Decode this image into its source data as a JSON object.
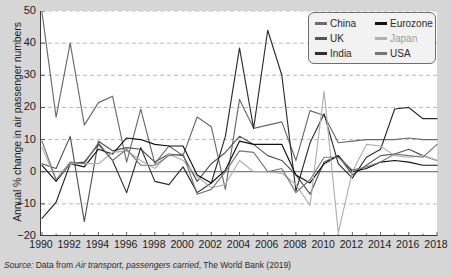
{
  "figure": {
    "partial_title": "",
    "caption": {
      "source_word": "Source:",
      "text_before": " Data from ",
      "work_title": "Air transport, passengers carried",
      "text_after": ", The World Bank (2019)"
    }
  },
  "legend": {
    "columns": [
      [
        {
          "label": "China",
          "color": "#6b6b6b"
        },
        {
          "label": "UK",
          "color": "#555555"
        },
        {
          "label": "India",
          "color": "#2e2e2e"
        }
      ],
      [
        {
          "label": "Eurozone",
          "color": "#111111"
        },
        {
          "label": "Japan",
          "color": "#b0b0b0"
        },
        {
          "label": "USA",
          "color": "#777777"
        }
      ]
    ]
  },
  "chart_data": {
    "type": "line",
    "title": "",
    "xlabel": "",
    "ylabel": "Annual % change in air passenger numbers",
    "xlim": [
      1990,
      2018
    ],
    "ylim": [
      -20,
      50
    ],
    "yticks": [
      50,
      40,
      30,
      20,
      10,
      0,
      -10,
      -20
    ],
    "xticks": [
      1990,
      1992,
      1994,
      1996,
      1998,
      2000,
      2002,
      2004,
      2006,
      2008,
      2010,
      2012,
      2014,
      2016,
      2018
    ],
    "minor_xticks_every": 1,
    "grid": "horizontal-dashed",
    "zero_line": true,
    "legend_position": "top-right",
    "x": [
      1990,
      1991,
      1992,
      1993,
      1994,
      1995,
      1996,
      1997,
      1998,
      1999,
      2000,
      2001,
      2002,
      2003,
      2004,
      2005,
      2006,
      2007,
      2008,
      2009,
      2010,
      2011,
      2012,
      2013,
      2014,
      2015,
      2016,
      2017,
      2018
    ],
    "series": [
      {
        "name": "China",
        "color": "#6b6b6b",
        "values": [
          49.5,
          17.0,
          40.0,
          14.5,
          21.5,
          23.5,
          3.0,
          19.5,
          2.5,
          8.0,
          5.0,
          17.0,
          14.0,
          -5.5,
          22.5,
          13.5,
          14.5,
          15.5,
          3.5,
          19.0,
          17.5,
          9.0,
          9.5,
          10.0,
          10.0,
          10.0,
          10.5,
          10.0,
          10.0
        ]
      },
      {
        "name": "UK",
        "color": "#555555",
        "values": [
          2.5,
          1.0,
          11.0,
          -15.5,
          9.5,
          6.5,
          7.5,
          7.0,
          3.0,
          5.5,
          5.0,
          -3.0,
          2.5,
          6.0,
          11.0,
          8.5,
          5.0,
          3.5,
          -1.0,
          -7.0,
          3.0,
          5.0,
          -1.0,
          2.0,
          5.0,
          5.5,
          7.0,
          5.0,
          3.5
        ]
      },
      {
        "name": "India",
        "color": "#2e2e2e",
        "values": [
          -14.5,
          -9.5,
          2.5,
          3.0,
          8.5,
          3.5,
          -6.5,
          7.5,
          -3.0,
          -4.0,
          1.5,
          -6.5,
          -3.5,
          11.0,
          38.5,
          13.5,
          44.0,
          30.0,
          -6.0,
          9.0,
          18.0,
          2.5,
          -2.0,
          4.5,
          7.0,
          19.5,
          20.0,
          16.5,
          16.5
        ]
      },
      {
        "name": "Eurozone",
        "color": "#111111",
        "values": [
          2.0,
          -3.0,
          2.5,
          1.5,
          7.0,
          5.5,
          10.5,
          10.0,
          8.5,
          8.0,
          8.0,
          -1.0,
          -3.5,
          0.5,
          9.5,
          8.5,
          8.5,
          8.5,
          -1.0,
          -3.5,
          2.5,
          5.0,
          0.0,
          1.0,
          3.0,
          3.5,
          3.0,
          2.0,
          2.0
        ]
      },
      {
        "name": "Japan",
        "color": "#b0b0b0",
        "values": [
          7.5,
          -2.5,
          2.5,
          2.5,
          2.5,
          6.0,
          6.5,
          3.5,
          1.0,
          5.5,
          3.5,
          -1.5,
          -5.0,
          -4.0,
          3.5,
          0.0,
          0.0,
          -0.5,
          -4.0,
          -10.5,
          25.0,
          -19.0,
          0.0,
          8.5,
          8.0,
          5.0,
          4.5,
          5.0,
          3.5
        ]
      },
      {
        "name": "USA",
        "color": "#777777",
        "values": [
          9.5,
          -2.5,
          3.0,
          2.5,
          9.0,
          3.5,
          7.0,
          2.0,
          2.0,
          5.0,
          5.5,
          -7.0,
          -5.5,
          0.0,
          6.5,
          6.0,
          0.0,
          1.0,
          -6.5,
          -2.5,
          4.5,
          4.5,
          0.5,
          1.5,
          3.0,
          5.5,
          5.0,
          4.5,
          8.5
        ]
      }
    ]
  }
}
